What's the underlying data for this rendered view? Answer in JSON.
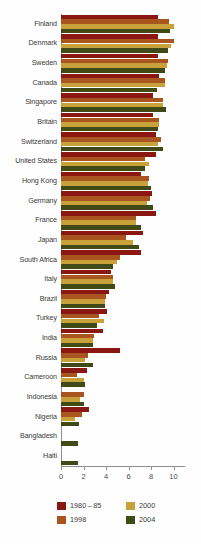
{
  "chart_data": {
    "type": "bar",
    "orientation": "horizontal",
    "title": "",
    "xlabel": "",
    "ylabel": "",
    "xlim": [
      0,
      11
    ],
    "xticks": [
      0,
      2,
      4,
      6,
      8,
      10
    ],
    "grid": false,
    "legend_position": "bottom",
    "categories": [
      "Finland",
      "Denmark",
      "Sweden",
      "Canada",
      "Singapore",
      "Britain",
      "Switzerland",
      "United States",
      "Hong Kong",
      "Germany",
      "France",
      "Japan",
      "South Africa",
      "Italy",
      "Brazil",
      "Turkey",
      "India",
      "Russia",
      "Cameroon",
      "Indonesia",
      "Nigeria",
      "Bangladesh",
      "Haiti"
    ],
    "series": [
      {
        "name": "1980-85",
        "color": "#8a1711",
        "values": [
          8.6,
          8.6,
          8.6,
          8.7,
          8.2,
          8.2,
          8.4,
          8.4,
          7.1,
          8.1,
          8.4,
          7.3,
          7.1,
          4.4,
          4.3,
          4.1,
          3.7,
          5.2,
          2.3,
          0.0,
          2.5,
          0.0,
          0.0
        ]
      },
      {
        "name": "1998",
        "color": "#a8551f",
        "values": [
          9.6,
          10.0,
          9.5,
          9.2,
          9.1,
          8.7,
          8.9,
          7.5,
          7.8,
          7.9,
          6.7,
          5.8,
          5.2,
          4.6,
          4.0,
          3.4,
          2.9,
          2.4,
          1.4,
          2.0,
          1.9,
          0.0,
          0.0
        ]
      },
      {
        "name": "2000",
        "color": "#c8a13a",
        "values": [
          10.0,
          9.8,
          9.4,
          9.2,
          9.1,
          8.7,
          8.6,
          7.8,
          7.7,
          7.6,
          6.7,
          6.4,
          5.0,
          4.6,
          3.9,
          3.8,
          2.8,
          2.1,
          2.0,
          1.7,
          1.2,
          0.0,
          0.0
        ]
      },
      {
        "name": "2004",
        "color": "#3f4a17",
        "values": [
          9.7,
          9.5,
          9.2,
          8.5,
          9.3,
          8.6,
          9.1,
          7.5,
          8.0,
          8.2,
          7.1,
          6.9,
          4.6,
          4.8,
          3.9,
          3.2,
          2.8,
          2.8,
          2.1,
          2.0,
          1.6,
          1.5,
          1.5
        ]
      }
    ]
  },
  "legend": {
    "items": [
      {
        "label": "1980 – 85",
        "color": "#8a1711"
      },
      {
        "label": "1998",
        "color": "#a8551f"
      },
      {
        "label": "2000",
        "color": "#c8a13a"
      },
      {
        "label": "2004",
        "color": "#3f4a17"
      }
    ]
  },
  "axis": {
    "tick_labels": [
      "0",
      "2",
      "4",
      "6",
      "8",
      "10"
    ]
  }
}
